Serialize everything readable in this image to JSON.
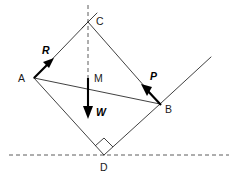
{
  "figure": {
    "width": 236,
    "height": 176,
    "background": "#ffffff",
    "line_color": "#2b2b2b",
    "vector_color": "#000000"
  },
  "points": [
    {
      "id": "A",
      "label": "A",
      "x": 34,
      "y": 78,
      "label_x": 18,
      "label_y": 73
    },
    {
      "id": "B",
      "label": "B",
      "x": 160,
      "y": 104,
      "label_x": 165,
      "label_y": 104
    },
    {
      "id": "C",
      "label": "C",
      "x": 88,
      "y": 22,
      "label_x": 96,
      "label_y": 16
    },
    {
      "id": "D",
      "label": "D",
      "x": 104,
      "y": 155,
      "label_x": 100,
      "label_y": 162
    }
  ],
  "edges": [
    {
      "id": "AC",
      "from": "A",
      "to": "C",
      "style": "solid"
    },
    {
      "id": "CB",
      "from": "C",
      "to": "B",
      "style": "solid"
    },
    {
      "id": "AB",
      "from": "A",
      "to": "B",
      "style": "solid"
    },
    {
      "id": "AD",
      "from": "A",
      "to": "D",
      "style": "solid"
    },
    {
      "id": "BD",
      "from": "B",
      "to": "D",
      "style": "solid"
    }
  ],
  "extensions": [
    {
      "id": "incline-up-right",
      "x1": 160,
      "y1": 104,
      "x2": 211,
      "y2": 57,
      "style": "solid"
    },
    {
      "id": "cb-beyond-c",
      "x1": 97,
      "y1": 13,
      "x2": 82,
      "y2": 28,
      "style": "solid"
    }
  ],
  "dashed_lines": [
    {
      "id": "vertical-through-c",
      "x1": 88,
      "y1": 5,
      "x2": 88,
      "y2": 78,
      "style": "dashed"
    },
    {
      "id": "ground-horizontal",
      "x1": 9,
      "y1": 155,
      "x2": 229,
      "y2": 155,
      "style": "dashed"
    }
  ],
  "right_angle": {
    "id": "right-angle-at-D",
    "vertex": "D",
    "marker_points": "95,146 104,138 113,147 104,155"
  },
  "vectors": [
    {
      "id": "R",
      "label": "R",
      "italic": true,
      "x1": 34,
      "y1": 78,
      "x2": 52,
      "y2": 60,
      "label_x": 42,
      "label_y": 45,
      "description": "reaction force at A, directed up and to the right"
    },
    {
      "id": "P",
      "label": "P",
      "italic": true,
      "x1": 161,
      "y1": 105,
      "x2": 143,
      "y2": 86,
      "label_x": 150,
      "label_y": 71,
      "description": "applied force at B, directed up and to the left"
    },
    {
      "id": "W",
      "label": "W",
      "italic": true,
      "x1": 88,
      "y1": 78,
      "x2": 88,
      "y2": 118,
      "label_x": 96,
      "label_y": 107,
      "description": "weight acting downward from the centre of mass M"
    }
  ],
  "annotations": [
    {
      "id": "M",
      "label": "M",
      "italic": false,
      "x": 94,
      "y": 73,
      "description": "centre of mass"
    }
  ]
}
